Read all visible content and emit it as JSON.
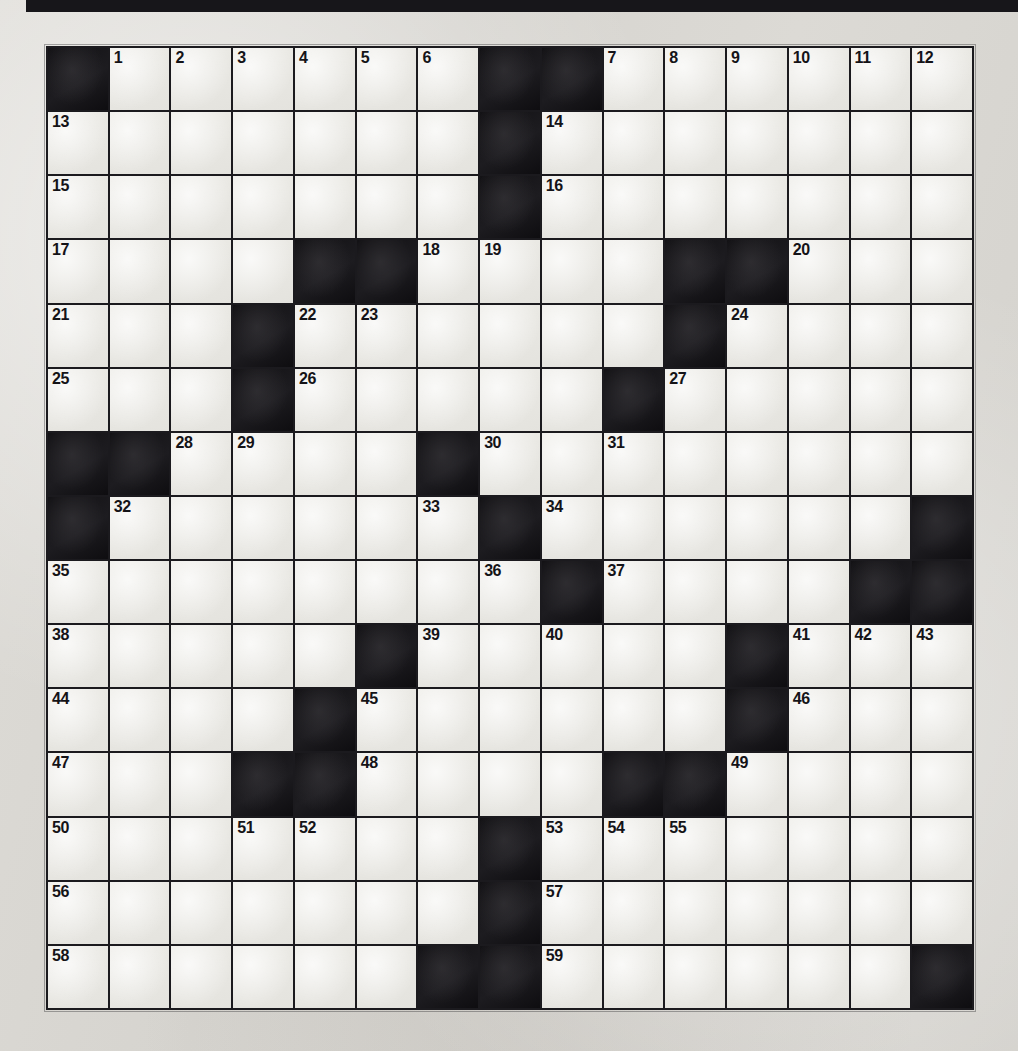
{
  "page": {
    "type": "crossword-puzzle-grid",
    "title": "",
    "rows": 15,
    "columns": 15,
    "colors": {
      "paper": "#d8d6d1",
      "cell_white": "#e9e8e3",
      "cell_block": "#17161a",
      "grid_line": "#1b1a1e",
      "number_text": "#141317"
    }
  },
  "top_rule": {
    "name": "top-black-rule",
    "visible": true
  },
  "grid": {
    "legend": {
      "1": "white (fillable) cell",
      "0": "black (blocked) cell"
    },
    "cells": [
      [
        0,
        1,
        1,
        1,
        1,
        1,
        1,
        0,
        0,
        1,
        1,
        1,
        1,
        1,
        1
      ],
      [
        1,
        1,
        1,
        1,
        1,
        1,
        1,
        0,
        1,
        1,
        1,
        1,
        1,
        1,
        1
      ],
      [
        1,
        1,
        1,
        1,
        1,
        1,
        1,
        0,
        1,
        1,
        1,
        1,
        1,
        1,
        1
      ],
      [
        1,
        1,
        1,
        1,
        0,
        0,
        1,
        1,
        1,
        1,
        0,
        0,
        1,
        1,
        1
      ],
      [
        1,
        1,
        1,
        0,
        1,
        1,
        1,
        1,
        1,
        1,
        0,
        1,
        1,
        1,
        1
      ],
      [
        1,
        1,
        1,
        0,
        1,
        1,
        1,
        1,
        1,
        0,
        1,
        1,
        1,
        1,
        1
      ],
      [
        0,
        0,
        1,
        1,
        1,
        1,
        0,
        1,
        1,
        1,
        1,
        1,
        1,
        1,
        1
      ],
      [
        0,
        1,
        1,
        1,
        1,
        1,
        1,
        0,
        1,
        1,
        1,
        1,
        1,
        1,
        0
      ],
      [
        1,
        1,
        1,
        1,
        1,
        1,
        1,
        1,
        0,
        1,
        1,
        1,
        1,
        0,
        0
      ],
      [
        1,
        1,
        1,
        1,
        1,
        0,
        1,
        1,
        1,
        1,
        1,
        0,
        1,
        1,
        1
      ],
      [
        1,
        1,
        1,
        1,
        0,
        1,
        1,
        1,
        1,
        1,
        1,
        0,
        1,
        1,
        1
      ],
      [
        1,
        1,
        1,
        0,
        0,
        1,
        1,
        1,
        1,
        0,
        0,
        1,
        1,
        1,
        1
      ],
      [
        1,
        1,
        1,
        1,
        1,
        1,
        1,
        0,
        1,
        1,
        1,
        1,
        1,
        1,
        1
      ],
      [
        1,
        1,
        1,
        1,
        1,
        1,
        1,
        0,
        1,
        1,
        1,
        1,
        1,
        1,
        1
      ],
      [
        1,
        1,
        1,
        1,
        1,
        1,
        0,
        0,
        1,
        1,
        1,
        1,
        1,
        1,
        0
      ]
    ],
    "numbers": [
      [
        "",
        "1",
        "2",
        "3",
        "4",
        "5",
        "6",
        "",
        "",
        "7",
        "8",
        "9",
        "10",
        "11",
        "12"
      ],
      [
        "13",
        "",
        "",
        "",
        "",
        "",
        "",
        "",
        "14",
        "",
        "",
        "",
        "",
        "",
        ""
      ],
      [
        "15",
        "",
        "",
        "",
        "",
        "",
        "",
        "",
        "16",
        "",
        "",
        "",
        "",
        "",
        ""
      ],
      [
        "17",
        "",
        "",
        "",
        "",
        "",
        "18",
        "19",
        "",
        "",
        "",
        "",
        "20",
        "",
        ""
      ],
      [
        "21",
        "",
        "",
        "",
        "22",
        "23",
        "",
        "",
        "",
        "",
        "",
        "24",
        "",
        "",
        ""
      ],
      [
        "25",
        "",
        "",
        "",
        "26",
        "",
        "",
        "",
        "",
        "",
        "27",
        "",
        "",
        "",
        ""
      ],
      [
        "",
        "",
        "28",
        "29",
        "",
        "",
        "",
        "30",
        "",
        "31",
        "",
        "",
        "",
        "",
        ""
      ],
      [
        "",
        "32",
        "",
        "",
        "",
        "",
        "33",
        "",
        "34",
        "",
        "",
        "",
        "",
        "",
        ""
      ],
      [
        "35",
        "",
        "",
        "",
        "",
        "",
        "",
        "36",
        "",
        "37",
        "",
        "",
        "",
        "",
        ""
      ],
      [
        "38",
        "",
        "",
        "",
        "",
        "",
        "39",
        "",
        "40",
        "",
        "",
        "",
        "41",
        "42",
        "43"
      ],
      [
        "44",
        "",
        "",
        "",
        "",
        "45",
        "",
        "",
        "",
        "",
        "",
        "",
        "46",
        "",
        ""
      ],
      [
        "47",
        "",
        "",
        "",
        "",
        "48",
        "",
        "",
        "",
        "",
        "",
        "49",
        "",
        "",
        ""
      ],
      [
        "50",
        "",
        "",
        "51",
        "52",
        "",
        "",
        "",
        "53",
        "54",
        "55",
        "",
        "",
        "",
        ""
      ],
      [
        "56",
        "",
        "",
        "",
        "",
        "",
        "",
        "",
        "57",
        "",
        "",
        "",
        "",
        "",
        ""
      ],
      [
        "58",
        "",
        "",
        "",
        "",
        "",
        "",
        "",
        "59",
        "",
        "",
        "",
        "",
        "",
        ""
      ]
    ],
    "letters": [
      [
        "",
        "",
        "",
        "",
        "",
        "",
        "",
        "",
        "",
        "",
        "",
        "",
        "",
        "",
        ""
      ],
      [
        "",
        "",
        "",
        "",
        "",
        "",
        "",
        "",
        "",
        "",
        "",
        "",
        "",
        "",
        ""
      ],
      [
        "",
        "",
        "",
        "",
        "",
        "",
        "",
        "",
        "",
        "",
        "",
        "",
        "",
        "",
        ""
      ],
      [
        "",
        "",
        "",
        "",
        "",
        "",
        "",
        "",
        "",
        "",
        "",
        "",
        "",
        "",
        ""
      ],
      [
        "",
        "",
        "",
        "",
        "",
        "",
        "",
        "",
        "",
        "",
        "",
        "",
        "",
        "",
        ""
      ],
      [
        "",
        "",
        "",
        "",
        "",
        "",
        "",
        "",
        "",
        "",
        "",
        "",
        "",
        "",
        ""
      ],
      [
        "",
        "",
        "",
        "",
        "",
        "",
        "",
        "",
        "",
        "",
        "",
        "",
        "",
        "",
        ""
      ],
      [
        "",
        "",
        "",
        "",
        "",
        "",
        "",
        "",
        "",
        "",
        "",
        "",
        "",
        "",
        ""
      ],
      [
        "",
        "",
        "",
        "",
        "",
        "",
        "",
        "",
        "",
        "",
        "",
        "",
        "",
        "",
        ""
      ],
      [
        "",
        "",
        "",
        "",
        "",
        "",
        "",
        "",
        "",
        "",
        "",
        "",
        "",
        "",
        ""
      ],
      [
        "",
        "",
        "",
        "",
        "",
        "",
        "",
        "",
        "",
        "",
        "",
        "",
        "",
        "",
        ""
      ],
      [
        "",
        "",
        "",
        "",
        "",
        "",
        "",
        "",
        "",
        "",
        "",
        "",
        "",
        "",
        ""
      ],
      [
        "",
        "",
        "",
        "",
        "",
        "",
        "",
        "",
        "",
        "",
        "",
        "",
        "",
        "",
        ""
      ],
      [
        "",
        "",
        "",
        "",
        "",
        "",
        "",
        "",
        "",
        "",
        "",
        "",
        "",
        "",
        ""
      ],
      [
        "",
        "",
        "",
        "",
        "",
        "",
        "",
        "",
        "",
        "",
        "",
        "",
        "",
        "",
        ""
      ]
    ],
    "clue_numbers_visible": [
      "1",
      "2",
      "3",
      "4",
      "5",
      "6",
      "7",
      "8",
      "9",
      "10",
      "11",
      "12",
      "13",
      "14",
      "15",
      "16",
      "17",
      "18",
      "19",
      "20",
      "21",
      "22",
      "23",
      "24",
      "25",
      "26",
      "27",
      "28",
      "29",
      "30",
      "31",
      "32",
      "33",
      "34",
      "35",
      "36",
      "37",
      "38",
      "39",
      "40",
      "41",
      "42",
      "43",
      "44",
      "45",
      "46",
      "47",
      "48",
      "49",
      "50",
      "51",
      "52",
      "53",
      "54",
      "55",
      "56",
      "57",
      "58",
      "59"
    ]
  }
}
